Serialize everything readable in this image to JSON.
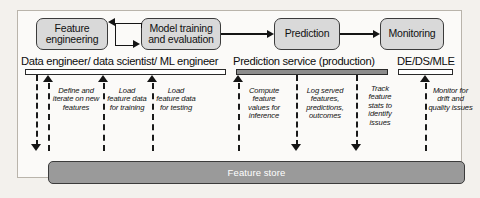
{
  "diagram": {
    "flow_boxes": [
      {
        "id": "feature-engineering",
        "label": "Feature engineering"
      },
      {
        "id": "model-training",
        "label": "Model training and evaluation"
      },
      {
        "id": "prediction",
        "label": "Prediction"
      },
      {
        "id": "monitoring",
        "label": "Monitoring"
      }
    ],
    "roles": [
      {
        "id": "data-team",
        "label": "Data engineer/ data scientist/ ML engineer",
        "bar_style": "outline"
      },
      {
        "id": "prediction-service",
        "label": "Prediction service (production)",
        "bar_style": "filled"
      },
      {
        "id": "de-ds-mle",
        "label": "DE/DS/MLE",
        "bar_style": "outline"
      }
    ],
    "annotations": [
      {
        "id": "define-iterate",
        "text": "Define and iterate on new features",
        "direction": "down"
      },
      {
        "id": "load-training",
        "text": "Load feature data for training",
        "direction": "up"
      },
      {
        "id": "load-testing",
        "text": "Load feature data for testing",
        "direction": "up"
      },
      {
        "id": "compute-inference",
        "text": "Compute feature values for inference",
        "direction": "up"
      },
      {
        "id": "log-served",
        "text": "Log served features, predictions, outcomes",
        "direction": "down"
      },
      {
        "id": "track-stats",
        "text": "Track feature stats to identify issues",
        "direction": "down"
      },
      {
        "id": "monitor-drift",
        "text": "Monitor for drift and quality issues",
        "direction": "up"
      }
    ],
    "store": {
      "label": "Feature store"
    },
    "colors": {
      "box_fill": "#d9d9d9",
      "box_border": "#3b3b3b",
      "store_fill": "#9a9a9a",
      "bar_filled": "#8c8c8c",
      "background": "#fbfaf8"
    }
  }
}
